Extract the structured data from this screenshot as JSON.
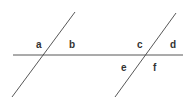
{
  "diagram": {
    "type": "transversal-angles",
    "line_color": "#444444",
    "label_color": "#333333",
    "lines": [
      {
        "id": "horizontal-line",
        "x1": 13,
        "y1": 55,
        "x2": 183,
        "y2": 55
      },
      {
        "id": "left-transversal",
        "x1": 12,
        "y1": 97,
        "x2": 75,
        "y2": 12
      },
      {
        "id": "right-transversal",
        "x1": 115,
        "y1": 97,
        "x2": 176,
        "y2": 13
      }
    ],
    "labels": [
      {
        "text": "a",
        "x": 36,
        "y": 48
      },
      {
        "text": "b",
        "x": 69,
        "y": 48
      },
      {
        "text": "c",
        "x": 137,
        "y": 48
      },
      {
        "text": "d",
        "x": 170,
        "y": 48
      },
      {
        "text": "e",
        "x": 121,
        "y": 71
      },
      {
        "text": "f",
        "x": 153,
        "y": 71
      }
    ]
  }
}
